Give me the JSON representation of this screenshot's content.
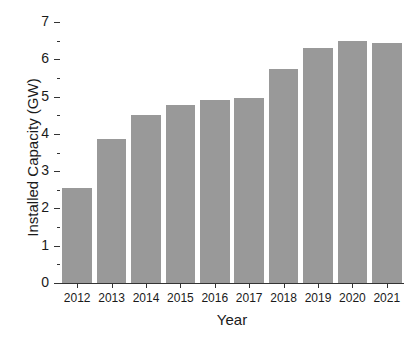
{
  "chart_data": {
    "type": "bar",
    "title": "",
    "xlabel": "Year",
    "ylabel": "Installed Capacity (GW)",
    "categories": [
      "2012",
      "2013",
      "2014",
      "2015",
      "2016",
      "2017",
      "2018",
      "2019",
      "2020",
      "2021"
    ],
    "values": [
      2.55,
      3.85,
      4.5,
      4.77,
      4.9,
      4.97,
      5.75,
      6.3,
      6.5,
      6.43
    ],
    "ylim": [
      0,
      7
    ],
    "y_ticks": [
      0,
      1,
      2,
      3,
      4,
      5,
      6,
      7
    ],
    "y_tick_labels": [
      "0",
      "1",
      "2",
      "3",
      "4",
      "5",
      "6",
      "7"
    ],
    "y_minor_ticks": [
      0.5,
      1.5,
      2.5,
      3.5,
      4.5,
      5.5,
      6.5
    ],
    "grid": false,
    "legend": null,
    "bar_color": "#999999",
    "axis_color": "#333333",
    "background_color": "#ffffff"
  }
}
